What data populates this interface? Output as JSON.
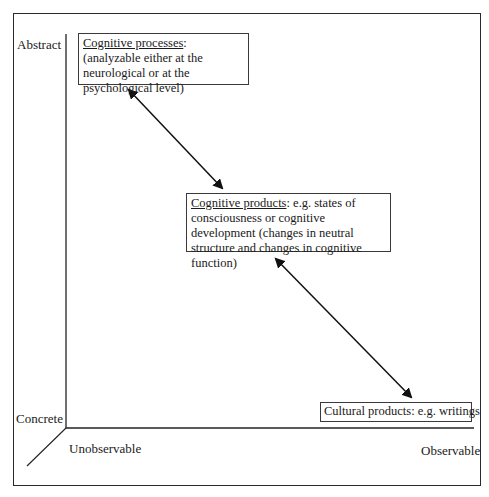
{
  "axes": {
    "y_top_label": "Abstract",
    "y_bottom_label": "Concrete",
    "x_left_label": "Unobservable",
    "x_right_label": "Observable"
  },
  "boxes": [
    {
      "title": "Cognitive processes",
      "text": ": (analyzable either at the neurological or at the psychological level)"
    },
    {
      "title": "Cognitive products",
      "text": ": e.g. states of consciousness or cognitive development (changes in neutral structure and changes in cognitive function)"
    },
    {
      "title": "",
      "text": "Cultural products: e.g. writings"
    }
  ],
  "arrows": [
    {
      "from": "Cognitive processes",
      "to": "Cognitive products",
      "type": "bidirectional"
    },
    {
      "from": "Cognitive products",
      "to": "Cultural products",
      "type": "bidirectional"
    }
  ]
}
